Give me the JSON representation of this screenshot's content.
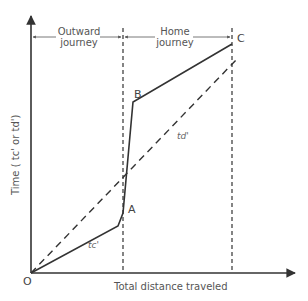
{
  "diagram": {
    "y_axis_label": "Time ( t_c' or t_d')",
    "y_axis_label_display": "Time ( tc' or td')",
    "x_axis_label": "Total distance traveled",
    "origin_label": "O",
    "segments": [
      {
        "label_line1": "Outward",
        "label_line2": "journey"
      },
      {
        "label_line1": "Home",
        "label_line2": "journey"
      }
    ],
    "points": {
      "A": "A",
      "B": "B",
      "C": "C"
    },
    "curves": [
      {
        "name": "t_c'",
        "label": "tc'",
        "style": "solid",
        "path": [
          "O",
          "A",
          "B",
          "C"
        ]
      },
      {
        "name": "t_d'",
        "label": "td'",
        "style": "dashed",
        "path": [
          "O",
          "C-dashed-end"
        ]
      }
    ],
    "colors": {
      "line": "#333333",
      "text": "#555555"
    }
  }
}
